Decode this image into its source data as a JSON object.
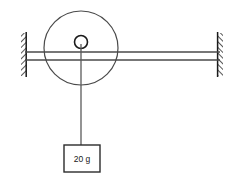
{
  "figure": {
    "kind": "physics-pulley-diagram",
    "background_color": "#ffffff",
    "line_color": "#3a3a3a",
    "dark_line_color": "#1a1a1a",
    "hatch_color": "#2b2b2b"
  },
  "supports": {
    "left_wall": {
      "name": "Left wall support",
      "x": 21,
      "y": 33,
      "width": 5,
      "height": 43,
      "hatched": true
    },
    "right_wall": {
      "name": "Right wall support",
      "x": 218,
      "y": 33,
      "width": 5,
      "height": 43,
      "hatched": true
    }
  },
  "string": {
    "name": "Horizontal string",
    "upper_line_y": 52,
    "lower_line_y": 60,
    "x_start": 24,
    "x_end": 221
  },
  "pulley": {
    "name": "Pulley wheel",
    "center_x": 81,
    "center_y": 48,
    "radius": 37,
    "hub_radius": 6.5,
    "hub_center_x": 81,
    "hub_center_y": 42
  },
  "vertical_string": {
    "name": "Vertical hanging string",
    "x": 81,
    "y_top": 46,
    "y_bottom": 145
  },
  "mass": {
    "name": "Hanging mass block",
    "label": "20 g",
    "value": "20",
    "unit": "g",
    "box_x": 64,
    "box_y": 145,
    "box_width": 36,
    "box_height": 27,
    "label_x": 82,
    "label_y": 162
  }
}
